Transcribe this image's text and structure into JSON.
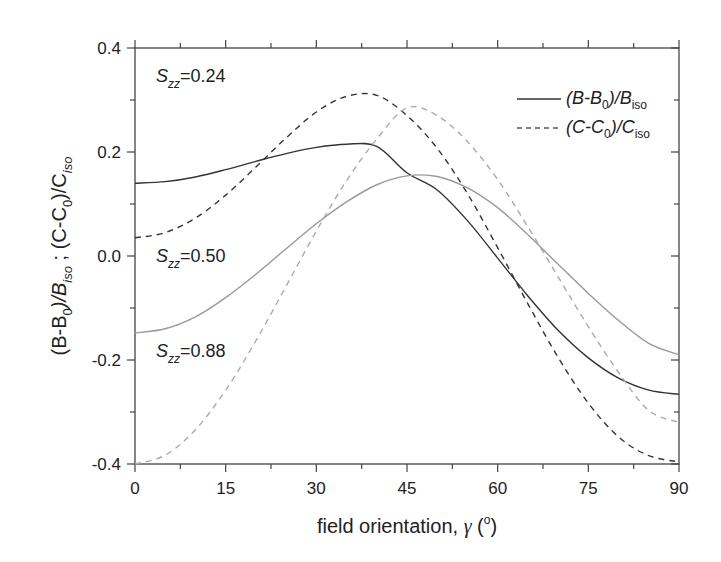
{
  "chart_data": {
    "type": "line",
    "title": "",
    "xlabel": "field orientation, γ (°)",
    "ylabel": "(B-B0)/Biso ; (C-C0)/Ciso",
    "xlim": [
      0,
      90
    ],
    "ylim": [
      -0.4,
      0.4
    ],
    "xticks": [
      "0",
      "15",
      "30",
      "45",
      "60",
      "75",
      "90"
    ],
    "yticks": [
      "-0.4",
      "-0.2",
      "0.0",
      "0.2",
      "0.4"
    ],
    "grid": false,
    "legend_position": "upper right",
    "legend": [
      {
        "label": "(B-B0)/Biso",
        "style": "solid"
      },
      {
        "label": "(C-C0)/Ciso",
        "style": "dashed"
      }
    ],
    "annotations": [
      "Szz=0.24",
      "Szz=0.50",
      "Szz=0.88"
    ],
    "x": [
      0,
      5,
      10,
      15,
      20,
      25,
      30,
      35,
      40,
      45,
      50,
      55,
      60,
      65,
      70,
      75,
      80,
      85,
      90
    ],
    "series": [
      {
        "name": "(B-B0)/Biso, Szz=0.24",
        "style": "solid",
        "color": "#333333",
        "values": [
          0.14,
          0.143,
          0.152,
          0.166,
          0.182,
          0.197,
          0.209,
          0.215,
          0.211,
          0.16,
          0.127,
          0.068,
          -0.004,
          -0.077,
          -0.143,
          -0.196,
          -0.235,
          -0.258,
          -0.266
        ]
      },
      {
        "name": "(C-C0)/Ciso, Szz=0.24",
        "style": "dashed",
        "color": "#333333",
        "values": [
          0.035,
          0.045,
          0.073,
          0.117,
          0.171,
          0.227,
          0.277,
          0.307,
          0.309,
          0.27,
          0.207,
          0.12,
          0.016,
          -0.092,
          -0.195,
          -0.283,
          -0.348,
          -0.384,
          -0.396
        ]
      },
      {
        "name": "(B-B0)/Biso, Szz=0.50",
        "style": "solid",
        "color": "#999999",
        "values": [
          -0.148,
          -0.14,
          -0.117,
          -0.08,
          -0.035,
          0.014,
          0.062,
          0.104,
          0.137,
          0.154,
          0.153,
          0.131,
          0.093,
          0.041,
          -0.016,
          -0.072,
          -0.124,
          -0.168,
          -0.19
        ]
      },
      {
        "name": "(C-C0)/Ciso, Szz=0.50",
        "style": "dashed",
        "color": "#aaaaaa",
        "values": [
          -0.4,
          -0.383,
          -0.334,
          -0.258,
          -0.163,
          -0.058,
          0.048,
          0.145,
          0.225,
          0.285,
          0.27,
          0.22,
          0.147,
          0.056,
          -0.04,
          -0.136,
          -0.224,
          -0.297,
          -0.32
        ]
      }
    ]
  },
  "labels": {
    "xlabel_text": "field orientation, ",
    "xlabel_symbol": "γ",
    "xlabel_unit_open": " (",
    "xlabel_unit_deg": "o",
    "xlabel_unit_close": ")",
    "legend_b": "(B-B",
    "legend_b_sub0": "0",
    "legend_b_mid": ")/B",
    "legend_b_subiso": "iso",
    "legend_c": "(C-C",
    "legend_c_sub0": "0",
    "legend_c_mid": ")/C",
    "legend_c_subiso": "iso",
    "annot_s": "S",
    "annot_sub": "zz",
    "annot_1_val": "=0.24",
    "annot_2_val": "=0.50",
    "annot_3_val": "=0.88",
    "ylabel_p1": "(B-B",
    "ylabel_p1_sub": "0",
    "ylabel_p2": ")/B",
    "ylabel_p2_sub": "iso",
    "ylabel_p3": " ;  (C-C",
    "ylabel_p3_sub": "0",
    "ylabel_p4": ")/C",
    "ylabel_p4_sub": "iso"
  }
}
